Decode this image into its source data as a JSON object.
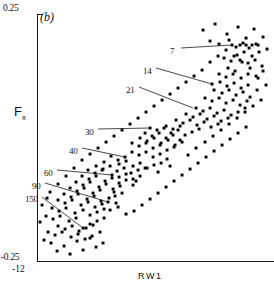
{
  "figure": {
    "panel_label": "(b)",
    "xlabel": "RW1",
    "ylabel_main": "F",
    "ylabel_sub": "x",
    "y_tick_top": "0.25",
    "y_tick_bottom": "-0.25",
    "x_tick_left": "-12"
  },
  "annotations": [
    {
      "label": "7",
      "lx": 170,
      "ly": 46,
      "x1": 181,
      "y1": 48,
      "x2": 232,
      "y2": 45
    },
    {
      "label": "14",
      "lx": 143,
      "ly": 66,
      "x1": 156,
      "y1": 68,
      "x2": 212,
      "y2": 84
    },
    {
      "label": "21",
      "lx": 126,
      "ly": 85,
      "x1": 139,
      "y1": 87,
      "x2": 193,
      "y2": 108
    },
    {
      "label": "30",
      "lx": 85,
      "ly": 127,
      "x1": 98,
      "y1": 129,
      "x2": 150,
      "y2": 128
    },
    {
      "label": "40",
      "lx": 69,
      "ly": 146,
      "x1": 82,
      "y1": 148,
      "x2": 125,
      "y2": 157
    },
    {
      "label": "60",
      "lx": 44,
      "ly": 168,
      "x1": 57,
      "y1": 170,
      "x2": 112,
      "y2": 175
    },
    {
      "label": "90",
      "lx": 32,
      "ly": 181,
      "x1": 45,
      "y1": 183,
      "x2": 108,
      "y2": 202
    },
    {
      "label": "150",
      "lx": 25,
      "ly": 194,
      "x1": 42,
      "y1": 197,
      "x2": 83,
      "y2": 228
    }
  ],
  "chart_data": {
    "type": "scatter",
    "title": "(b)",
    "xlabel": "RW1",
    "ylabel": "Fx",
    "xlim": [
      -12,
      12
    ],
    "ylim": [
      -0.25,
      0.25
    ],
    "grid": false,
    "legend": "none",
    "series_name": "specimens",
    "annotation_values": [
      7,
      14,
      21,
      30,
      40,
      60,
      90,
      150
    ],
    "points_px": [
      [
        203,
        30
      ],
      [
        215,
        24
      ],
      [
        227,
        34
      ],
      [
        238,
        27
      ],
      [
        246,
        38
      ],
      [
        254,
        29
      ],
      [
        263,
        37
      ],
      [
        210,
        41
      ],
      [
        219,
        44
      ],
      [
        229,
        40
      ],
      [
        236,
        47
      ],
      [
        243,
        43
      ],
      [
        249,
        48
      ],
      [
        256,
        44
      ],
      [
        232,
        45
      ],
      [
        240,
        45
      ],
      [
        246,
        45
      ],
      [
        252,
        45
      ],
      [
        258,
        45
      ],
      [
        244,
        52
      ],
      [
        237,
        55
      ],
      [
        252,
        56
      ],
      [
        259,
        52
      ],
      [
        267,
        49
      ],
      [
        224,
        58
      ],
      [
        231,
        61
      ],
      [
        240,
        60
      ],
      [
        248,
        63
      ],
      [
        255,
        60
      ],
      [
        262,
        66
      ],
      [
        228,
        68
      ],
      [
        235,
        71
      ],
      [
        219,
        74
      ],
      [
        226,
        77
      ],
      [
        233,
        74
      ],
      [
        241,
        78
      ],
      [
        248,
        74
      ],
      [
        256,
        76
      ],
      [
        263,
        71
      ],
      [
        212,
        84
      ],
      [
        220,
        82
      ],
      [
        227,
        86
      ],
      [
        234,
        83
      ],
      [
        241,
        88
      ],
      [
        248,
        85
      ],
      [
        214,
        90
      ],
      [
        222,
        93
      ],
      [
        229,
        90
      ],
      [
        236,
        95
      ],
      [
        243,
        92
      ],
      [
        250,
        97
      ],
      [
        257,
        90
      ],
      [
        205,
        98
      ],
      [
        212,
        101
      ],
      [
        219,
        98
      ],
      [
        226,
        103
      ],
      [
        233,
        100
      ],
      [
        240,
        105
      ],
      [
        247,
        101
      ],
      [
        196,
        108
      ],
      [
        203,
        111
      ],
      [
        210,
        108
      ],
      [
        217,
        113
      ],
      [
        224,
        110
      ],
      [
        231,
        115
      ],
      [
        238,
        112
      ],
      [
        245,
        108
      ],
      [
        186,
        114
      ],
      [
        193,
        117
      ],
      [
        200,
        114
      ],
      [
        207,
        119
      ],
      [
        214,
        116
      ],
      [
        221,
        121
      ],
      [
        228,
        118
      ],
      [
        176,
        120
      ],
      [
        183,
        123
      ],
      [
        190,
        120
      ],
      [
        197,
        125
      ],
      [
        204,
        122
      ],
      [
        211,
        127
      ],
      [
        218,
        124
      ],
      [
        166,
        126
      ],
      [
        173,
        129
      ],
      [
        180,
        126
      ],
      [
        150,
        128
      ],
      [
        157,
        130
      ],
      [
        164,
        128
      ],
      [
        171,
        133
      ],
      [
        178,
        130
      ],
      [
        185,
        135
      ],
      [
        192,
        132
      ],
      [
        199,
        129
      ],
      [
        145,
        133
      ],
      [
        152,
        136
      ],
      [
        159,
        133
      ],
      [
        166,
        138
      ],
      [
        173,
        135
      ],
      [
        180,
        140
      ],
      [
        140,
        138
      ],
      [
        147,
        141
      ],
      [
        154,
        138
      ],
      [
        161,
        143
      ],
      [
        168,
        140
      ],
      [
        175,
        145
      ],
      [
        182,
        142
      ],
      [
        132,
        143
      ],
      [
        139,
        146
      ],
      [
        146,
        143
      ],
      [
        153,
        148
      ],
      [
        160,
        145
      ],
      [
        167,
        150
      ],
      [
        174,
        147
      ],
      [
        125,
        157
      ],
      [
        132,
        152
      ],
      [
        139,
        155
      ],
      [
        146,
        152
      ],
      [
        153,
        157
      ],
      [
        160,
        154
      ],
      [
        167,
        159
      ],
      [
        118,
        160
      ],
      [
        111,
        156
      ],
      [
        104,
        162
      ],
      [
        119,
        164
      ],
      [
        126,
        161
      ],
      [
        133,
        166
      ],
      [
        140,
        163
      ],
      [
        147,
        168
      ],
      [
        154,
        165
      ],
      [
        161,
        163
      ],
      [
        96,
        166
      ],
      [
        103,
        169
      ],
      [
        110,
        166
      ],
      [
        117,
        171
      ],
      [
        124,
        168
      ],
      [
        131,
        173
      ],
      [
        138,
        170
      ],
      [
        145,
        168
      ],
      [
        88,
        170
      ],
      [
        95,
        173
      ],
      [
        102,
        170
      ],
      [
        112,
        175
      ],
      [
        119,
        177
      ],
      [
        126,
        174
      ],
      [
        133,
        179
      ],
      [
        140,
        176
      ],
      [
        82,
        176
      ],
      [
        89,
        179
      ],
      [
        96,
        176
      ],
      [
        105,
        181
      ],
      [
        112,
        178
      ],
      [
        119,
        183
      ],
      [
        126,
        180
      ],
      [
        133,
        185
      ],
      [
        76,
        182
      ],
      [
        83,
        185
      ],
      [
        90,
        182
      ],
      [
        99,
        187
      ],
      [
        106,
        184
      ],
      [
        113,
        189
      ],
      [
        120,
        186
      ],
      [
        70,
        188
      ],
      [
        77,
        191
      ],
      [
        84,
        188
      ],
      [
        93,
        193
      ],
      [
        100,
        190
      ],
      [
        108,
        202
      ],
      [
        115,
        196
      ],
      [
        122,
        193
      ],
      [
        64,
        194
      ],
      [
        71,
        197
      ],
      [
        78,
        194
      ],
      [
        87,
        199
      ],
      [
        94,
        196
      ],
      [
        101,
        201
      ],
      [
        109,
        198
      ],
      [
        116,
        203
      ],
      [
        58,
        200
      ],
      [
        65,
        203
      ],
      [
        72,
        200
      ],
      [
        81,
        205
      ],
      [
        88,
        202
      ],
      [
        95,
        207
      ],
      [
        102,
        204
      ],
      [
        52,
        208
      ],
      [
        59,
        211
      ],
      [
        66,
        208
      ],
      [
        75,
        213
      ],
      [
        83,
        210
      ],
      [
        90,
        215
      ],
      [
        97,
        212
      ],
      [
        104,
        209
      ],
      [
        46,
        216
      ],
      [
        53,
        219
      ],
      [
        60,
        216
      ],
      [
        69,
        221
      ],
      [
        76,
        218
      ],
      [
        83,
        228
      ],
      [
        90,
        224
      ],
      [
        97,
        221
      ],
      [
        104,
        218
      ],
      [
        58,
        226
      ],
      [
        65,
        229
      ],
      [
        72,
        226
      ],
      [
        79,
        231
      ],
      [
        86,
        228
      ],
      [
        93,
        225
      ],
      [
        100,
        232
      ],
      [
        48,
        232
      ],
      [
        55,
        235
      ],
      [
        62,
        232
      ],
      [
        71,
        237
      ],
      [
        78,
        234
      ],
      [
        85,
        239
      ],
      [
        92,
        236
      ],
      [
        44,
        240
      ],
      [
        51,
        243
      ],
      [
        64,
        246
      ],
      [
        77,
        241
      ],
      [
        90,
        238
      ],
      [
        103,
        243
      ],
      [
        57,
        251
      ],
      [
        70,
        254
      ],
      [
        83,
        250
      ],
      [
        96,
        247
      ],
      [
        40,
        222
      ],
      [
        42,
        205
      ],
      [
        47,
        198
      ],
      [
        114,
        192
      ],
      [
        136,
        181
      ],
      [
        158,
        172
      ],
      [
        170,
        166
      ],
      [
        188,
        155
      ],
      [
        196,
        148
      ],
      [
        205,
        142
      ],
      [
        213,
        136
      ],
      [
        221,
        130
      ],
      [
        229,
        124
      ],
      [
        237,
        118
      ],
      [
        245,
        112
      ],
      [
        253,
        106
      ],
      [
        261,
        100
      ],
      [
        266,
        85
      ],
      [
        258,
        78
      ],
      [
        250,
        68
      ],
      [
        242,
        62
      ],
      [
        234,
        56
      ],
      [
        226,
        50
      ],
      [
        218,
        56
      ],
      [
        210,
        62
      ],
      [
        202,
        70
      ],
      [
        194,
        76
      ],
      [
        186,
        82
      ],
      [
        178,
        88
      ],
      [
        170,
        94
      ],
      [
        162,
        100
      ],
      [
        154,
        106
      ],
      [
        146,
        112
      ],
      [
        138,
        118
      ],
      [
        130,
        124
      ],
      [
        122,
        130
      ],
      [
        114,
        136
      ],
      [
        106,
        142
      ],
      [
        98,
        148
      ],
      [
        90,
        154
      ],
      [
        82,
        160
      ],
      [
        74,
        168
      ],
      [
        66,
        176
      ],
      [
        58,
        184
      ],
      [
        50,
        192
      ],
      [
        110,
        210
      ],
      [
        118,
        207
      ],
      [
        126,
        214
      ],
      [
        134,
        211
      ],
      [
        142,
        205
      ],
      [
        150,
        199
      ],
      [
        158,
        193
      ],
      [
        166,
        187
      ],
      [
        174,
        181
      ],
      [
        182,
        175
      ],
      [
        190,
        169
      ],
      [
        198,
        163
      ],
      [
        206,
        157
      ],
      [
        214,
        151
      ],
      [
        222,
        145
      ],
      [
        230,
        139
      ],
      [
        238,
        133
      ],
      [
        246,
        127
      ]
    ]
  }
}
